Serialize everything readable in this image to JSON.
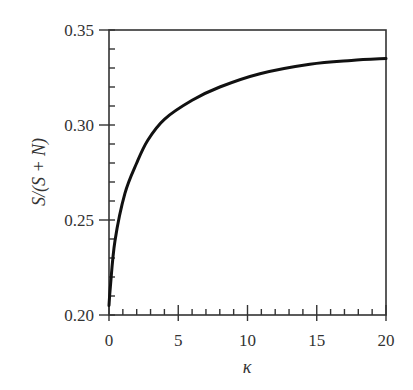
{
  "chart_data": {
    "type": "line",
    "title": "",
    "xlabel": "κ",
    "ylabel": "S/(S + N)",
    "xlim": [
      0,
      20
    ],
    "ylim": [
      0.2,
      0.35
    ],
    "x_ticks": [
      0,
      5,
      10,
      15,
      20
    ],
    "x_tick_labels": [
      "0",
      "5",
      "10",
      "15",
      "20"
    ],
    "x_minor_step": 1,
    "y_ticks": [
      0.2,
      0.25,
      0.3,
      0.35
    ],
    "y_tick_labels": [
      "0.20",
      "0.25",
      "0.30",
      "0.35"
    ],
    "y_minor_step": 0.01,
    "grid": false,
    "legend": null,
    "series": [
      {
        "name": "S/(S + N)",
        "color": "#111111",
        "x": [
          0,
          0.1,
          0.43,
          1.15,
          2.0,
          2.8,
          4.0,
          6.0,
          8.0,
          10.9,
          14.5,
          17.5,
          20
        ],
        "y": [
          0.205,
          0.215,
          0.239,
          0.264,
          0.28,
          0.292,
          0.303,
          0.313,
          0.32,
          0.327,
          0.332,
          0.334,
          0.335
        ]
      }
    ]
  }
}
